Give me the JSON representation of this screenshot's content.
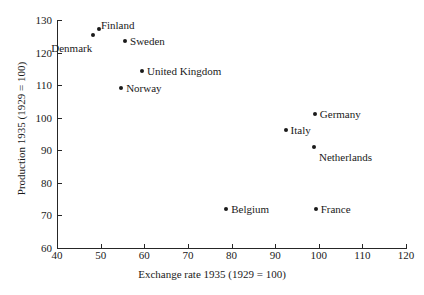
{
  "chart_data": {
    "type": "scatter",
    "title": "",
    "xlabel": "Exchange rate 1935 (1929 = 100)",
    "ylabel": "Production 1935 (1929 = 100)",
    "xlim": [
      40,
      120
    ],
    "ylim": [
      60,
      130
    ],
    "xticks": [
      40,
      50,
      60,
      70,
      80,
      90,
      100,
      110,
      120
    ],
    "yticks": [
      60,
      70,
      80,
      90,
      100,
      110,
      120,
      130
    ],
    "xticklabels": [
      "40",
      "50",
      "60",
      "70",
      "80",
      "90",
      "100",
      "110",
      "120"
    ],
    "yticklabels": [
      "60",
      "70",
      "80",
      "90",
      "100",
      "110",
      "120",
      "130"
    ],
    "grid": false,
    "legend": false,
    "marker_color": "#1a1a1a",
    "points": [
      {
        "label": "Denmark",
        "x": 48.3,
        "y": 125.3,
        "label_pos": "left"
      },
      {
        "label": "Finland",
        "x": 49.6,
        "y": 127.1,
        "label_pos": "right"
      },
      {
        "label": "Sweden",
        "x": 55.6,
        "y": 123.7,
        "label_pos": "right"
      },
      {
        "label": "United Kingdom",
        "x": 59.5,
        "y": 114.4,
        "label_pos": "right"
      },
      {
        "label": "Norway",
        "x": 54.7,
        "y": 109.0,
        "label_pos": "right"
      },
      {
        "label": "Germany",
        "x": 99.1,
        "y": 101.1,
        "label_pos": "right"
      },
      {
        "label": "Italy",
        "x": 92.4,
        "y": 96.2,
        "label_pos": "right"
      },
      {
        "label": "Netherlands",
        "x": 98.9,
        "y": 91.0,
        "label_pos": "right"
      },
      {
        "label": "Belgium",
        "x": 78.8,
        "y": 72.0,
        "label_pos": "right"
      },
      {
        "label": "France",
        "x": 99.3,
        "y": 72.0,
        "label_pos": "right"
      }
    ]
  }
}
